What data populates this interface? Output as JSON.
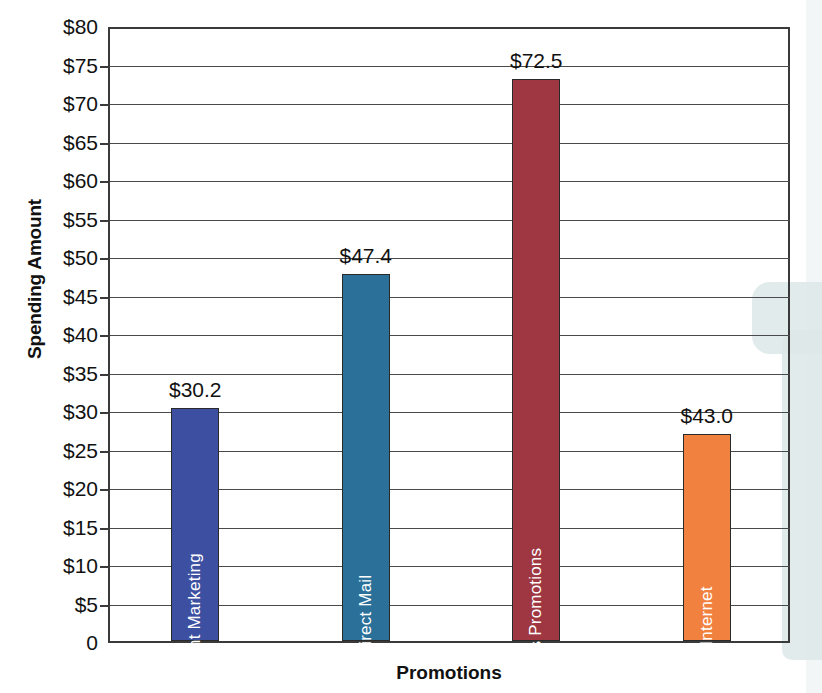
{
  "chart_data": {
    "type": "bar",
    "title": "",
    "xlabel": "Promotions",
    "ylabel": "Spending Amount",
    "categories": [
      "Event Marketing",
      "Direct Mail",
      "Sales Promotions",
      "Internet"
    ],
    "values": [
      30.2,
      47.4,
      72.5,
      43.0
    ],
    "bar_tops_plotted": [
      30.2,
      47.7,
      73.0,
      26.9
    ],
    "data_labels": [
      "$30.2",
      "$47.4",
      "$72.5",
      "$43.0"
    ],
    "series": [
      {
        "name": "Spending Amount",
        "values": [
          30.2,
          47.4,
          72.5,
          43.0
        ]
      }
    ],
    "colors": [
      "#3d4fa0",
      "#2a7099",
      "#9e3741",
      "#f0813f"
    ],
    "ylim": [
      0,
      80
    ],
    "ytick_values": [
      0,
      5,
      10,
      15,
      20,
      25,
      30,
      35,
      40,
      45,
      50,
      55,
      60,
      65,
      70,
      75,
      80
    ],
    "ytick_labels": [
      "0",
      "$5",
      "$10",
      "$15",
      "$20",
      "$25",
      "$30",
      "$35",
      "$40",
      "$45",
      "$50",
      "$55",
      "$60",
      "$65",
      "$70",
      "$75",
      "$80"
    ],
    "grid": true,
    "grid_axis": "y",
    "legend": false,
    "legend_position": "none"
  },
  "axes": {
    "y_title": "Spending Amount",
    "x_title": "Promotions"
  }
}
